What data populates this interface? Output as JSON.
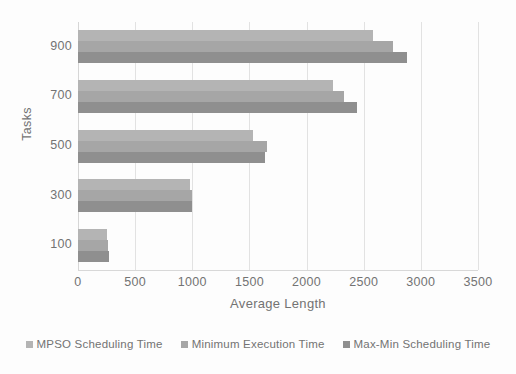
{
  "chart_data": {
    "type": "bar",
    "orientation": "horizontal",
    "title": "",
    "xlabel": "Average Length",
    "ylabel": "Tasks",
    "categories": [
      "100",
      "300",
      "500",
      "700",
      "900"
    ],
    "series": [
      {
        "name": "MPSO Scheduling Time",
        "color": "#b4b4b4",
        "values": [
          255,
          980,
          1530,
          2230,
          2580
        ]
      },
      {
        "name": "Minimum Execution Time",
        "color": "#a6a6a6",
        "values": [
          265,
          1000,
          1650,
          2330,
          2760
        ]
      },
      {
        "name": "Max-Min Scheduling Time",
        "color": "#8f8f8f",
        "values": [
          270,
          1000,
          1640,
          2440,
          2880
        ]
      }
    ],
    "xlim": [
      0,
      3500
    ],
    "x_ticks": [
      "0",
      "500",
      "1000",
      "1500",
      "2000",
      "2500",
      "3000",
      "3500"
    ],
    "x_tick_values": [
      0,
      500,
      1000,
      1500,
      2000,
      2500,
      3000,
      3500
    ],
    "y_ticks": [
      "900",
      "700",
      "500",
      "300",
      "100"
    ],
    "grid": "vertical",
    "legend_position": "bottom",
    "background": "#fdfdfd",
    "gridline_color": "#e2e2e2",
    "tick_label_color": "#737373"
  },
  "legend": {
    "items": [
      {
        "label": "MPSO Scheduling Time"
      },
      {
        "label": "Minimum Execution Time"
      },
      {
        "label": "Max-Min Scheduling Time"
      }
    ]
  }
}
